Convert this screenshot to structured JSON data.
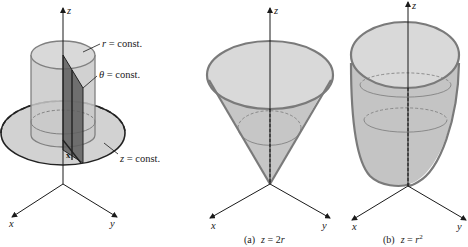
{
  "figure": {
    "colors": {
      "surface_fill": "#d6d6d6",
      "surface_fill_dark": "#bdbdbd",
      "plane_fill": "#6a6a6a",
      "outline": "#7a7a7a",
      "axis": "#1a1a1a",
      "text": "#1a1a1a"
    },
    "left_panel": {
      "axes": {
        "z": "z",
        "x": "x",
        "y": "y"
      },
      "point_label": "x",
      "annotations": [
        {
          "name": "r",
          "symbol": "r",
          "text": " = const."
        },
        {
          "name": "theta",
          "symbol": "θ",
          "text": " = const."
        },
        {
          "name": "z",
          "symbol": "z",
          "text": " = const."
        }
      ]
    },
    "panel_a": {
      "axes": {
        "z": "z",
        "x": "x",
        "y": "y"
      },
      "caption_label": "(a)",
      "caption_eq_lhs": "z",
      "caption_eq_rhs": " = 2",
      "caption_eq_var": "r",
      "surface": "cone"
    },
    "panel_b": {
      "axes": {
        "z": "z",
        "x": "x",
        "y": "y"
      },
      "caption_label": "(b)",
      "caption_eq_lhs": "z",
      "caption_eq_rhs": " = ",
      "caption_eq_var": "r",
      "caption_exponent": "2",
      "surface": "paraboloid"
    }
  }
}
